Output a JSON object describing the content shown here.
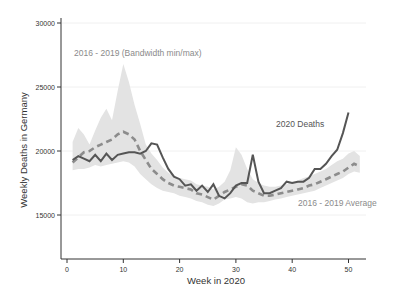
{
  "chart_data": {
    "type": "line",
    "title": "",
    "xlabel": "Week in 2020",
    "ylabel": "Weekly Deaths in Germany",
    "xlim": [
      -1,
      53
    ],
    "ylim": [
      12000,
      30500
    ],
    "xticks": [
      0,
      10,
      20,
      30,
      40,
      50
    ],
    "yticks": [
      15000,
      20000,
      25000,
      30000
    ],
    "grid": "horizontal (faint)",
    "annotations": [
      {
        "text": "2016 - 2019 (Bandwidth min/max)",
        "x": 2.5,
        "y": 27700,
        "color": "#8a8a8a"
      },
      {
        "text": "2020 Deaths",
        "x": 37.5,
        "y": 22300,
        "color": "#555555"
      },
      {
        "text": "2016 - 2019 Average",
        "x": 36.5,
        "y": 17600,
        "color": "#8a8a8a"
      }
    ],
    "x": [
      1,
      2,
      3,
      4,
      5,
      6,
      7,
      8,
      9,
      10,
      11,
      12,
      13,
      14,
      15,
      16,
      17,
      18,
      19,
      20,
      21,
      22,
      23,
      24,
      25,
      26,
      27,
      28,
      29,
      30,
      31,
      32,
      33,
      34,
      35,
      36,
      37,
      38,
      39,
      40,
      41,
      42,
      43,
      44,
      45,
      46,
      47,
      48,
      49,
      50,
      51,
      52
    ],
    "series": [
      {
        "name": "2020 Deaths",
        "color": "#555555",
        "style": "solid",
        "x": [
          1,
          2,
          3,
          4,
          5,
          6,
          7,
          8,
          9,
          10,
          11,
          12,
          13,
          14,
          15,
          16,
          17,
          18,
          19,
          20,
          21,
          22,
          23,
          24,
          25,
          26,
          27,
          28,
          29,
          30,
          31,
          32,
          33,
          34,
          35,
          36,
          37,
          38,
          39,
          40,
          41,
          42,
          43,
          44,
          45,
          46,
          47,
          48,
          49,
          50
        ],
        "values": [
          19300,
          19600,
          19400,
          19200,
          19700,
          19200,
          19800,
          19300,
          19700,
          19800,
          19900,
          19900,
          19800,
          20000,
          20600,
          20500,
          19500,
          18600,
          18000,
          17800,
          17300,
          17400,
          16900,
          17300,
          16800,
          17400,
          16500,
          16300,
          16700,
          17300,
          17500,
          17500,
          19700,
          17600,
          16700,
          16700,
          16900,
          17100,
          17600,
          17500,
          17600,
          17600,
          17900,
          18600,
          18600,
          19000,
          19600,
          20100,
          21400,
          23000
        ]
      },
      {
        "name": "2016 - 2019 Average",
        "color": "#8c8c8c",
        "style": "dashed",
        "x": [
          1,
          2,
          3,
          4,
          5,
          6,
          7,
          8,
          9,
          10,
          11,
          12,
          13,
          14,
          15,
          16,
          17,
          18,
          19,
          20,
          21,
          22,
          23,
          24,
          25,
          26,
          27,
          28,
          29,
          30,
          31,
          32,
          33,
          34,
          35,
          36,
          37,
          38,
          39,
          40,
          41,
          42,
          43,
          44,
          45,
          46,
          47,
          48,
          49,
          50,
          51,
          52
        ],
        "values": [
          19100,
          19500,
          19900,
          20000,
          20300,
          20500,
          20700,
          20900,
          21300,
          21500,
          21300,
          20900,
          20000,
          19300,
          18600,
          18200,
          17800,
          17500,
          17300,
          17200,
          17100,
          17000,
          16700,
          16600,
          16400,
          16200,
          16500,
          16800,
          17000,
          17200,
          17400,
          17300,
          16900,
          16700,
          16500,
          16500,
          16600,
          16700,
          16800,
          16900,
          17000,
          17100,
          17300,
          17400,
          17600,
          17800,
          18000,
          18200,
          18400,
          18700,
          19000,
          18800
        ]
      },
      {
        "name": "2016 - 2019 (Bandwidth min/max)",
        "color": "#e3e3e3",
        "style": "band",
        "x": [
          1,
          2,
          3,
          4,
          5,
          6,
          7,
          8,
          9,
          10,
          11,
          12,
          13,
          14,
          15,
          16,
          17,
          18,
          19,
          20,
          21,
          22,
          23,
          24,
          25,
          26,
          27,
          28,
          29,
          30,
          31,
          32,
          33,
          34,
          35,
          36,
          37,
          38,
          39,
          40,
          41,
          42,
          43,
          44,
          45,
          46,
          47,
          48,
          49,
          50,
          51,
          52
        ],
        "min": [
          18500,
          18600,
          18600,
          18700,
          18900,
          18800,
          18900,
          19000,
          19100,
          19200,
          19100,
          18800,
          18200,
          17800,
          17400,
          17100,
          16900,
          16800,
          16700,
          16500,
          16400,
          16300,
          16100,
          16000,
          15800,
          15700,
          15900,
          16200,
          16300,
          16400,
          16300,
          16000,
          15900,
          16000,
          16000,
          16100,
          16200,
          16300,
          16400,
          16500,
          16600,
          16700,
          16800,
          16900,
          17100,
          17300,
          17500,
          17700,
          17900,
          18200,
          18400,
          18300
        ],
        "max": [
          20700,
          21800,
          21300,
          20500,
          21600,
          22600,
          23300,
          22400,
          24700,
          26800,
          25400,
          23600,
          22100,
          20500,
          19800,
          19300,
          18700,
          18300,
          18000,
          17900,
          17800,
          17700,
          17400,
          17300,
          17200,
          17000,
          17200,
          17600,
          18500,
          20300,
          19700,
          18600,
          17800,
          17500,
          17300,
          17200,
          17200,
          17300,
          17400,
          17600,
          17700,
          17900,
          18000,
          18200,
          18400,
          18600,
          18900,
          19200,
          19400,
          19800,
          20000,
          19600
        ]
      }
    ]
  }
}
